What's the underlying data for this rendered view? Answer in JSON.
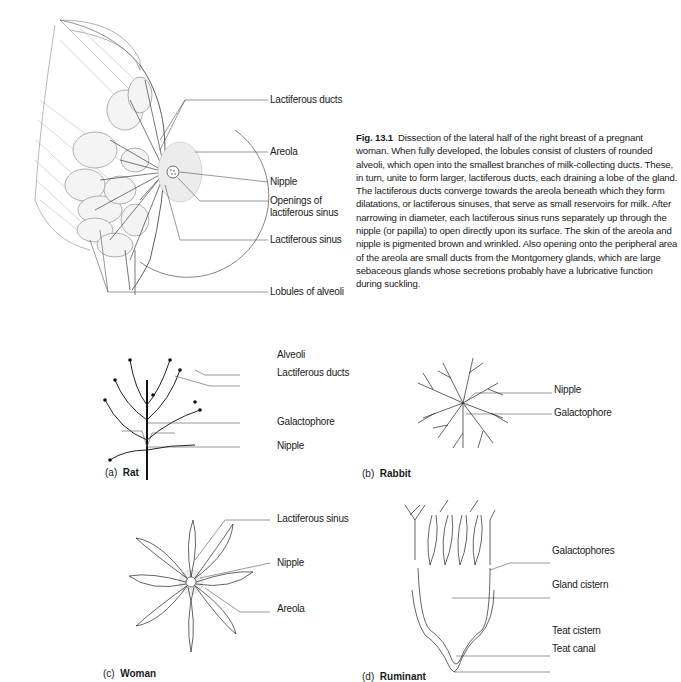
{
  "figure": {
    "number": "Fig. 13.1",
    "caption": "Dissection of the lateral half of the right breast of a pregnant woman. When fully developed, the lobules consist of clusters of rounded alveoli, which open into the smallest branches of milk-collecting ducts. These, in turn, unite to form larger, lactiferous ducts, each draining a lobe of the gland. The lactiferous ducts converge towards the areola beneath which they form dilatations, or lactiferous sinuses, that serve as small reservoirs for milk. After narrowing in diameter, each lactiferous sinus runs separately up through the nipple (or papilla) to open directly upon its surface. The skin of the areola and nipple is pigmented brown and wrinkled. Also opening onto the peripheral area of the areola are small ducts from the Montgomery glands, which are large sebaceous glands whose secretions probably have a lubricative function during suckling."
  },
  "main_diagram": {
    "labels": [
      "Lactiferous ducts",
      "Areola",
      "Nipple",
      "Openings of",
      "lactiferous sinus",
      "Lactiferous sinus",
      "Lobules of alveoli"
    ]
  },
  "panels": [
    {
      "letter": "(a)",
      "name": "Rat",
      "labels": [
        "Alveoli",
        "Lactiferous ducts",
        "Galactophore",
        "Nipple"
      ]
    },
    {
      "letter": "(b)",
      "name": "Rabbit",
      "labels": [
        "Nipple",
        "Galactophore"
      ]
    },
    {
      "letter": "(c)",
      "name": "Woman",
      "labels": [
        "Lactiferous sinus",
        "Nipple",
        "Areola"
      ]
    },
    {
      "letter": "(d)",
      "name": "Ruminant",
      "labels": [
        "Galactophores",
        "Gland cistern",
        "Teat cistern",
        "Teat canal"
      ]
    }
  ]
}
